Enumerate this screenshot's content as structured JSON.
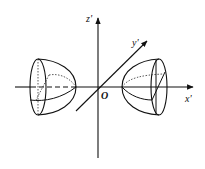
{
  "diagram": {
    "type": "3d-coordinate-sketch",
    "axes": {
      "x": {
        "label": "x'"
      },
      "y": {
        "label": "y'"
      },
      "z": {
        "label": "z'"
      },
      "origin": {
        "label": "O"
      }
    },
    "solids": [
      {
        "name": "left-dome-solid",
        "position": "negative x",
        "opens_toward": "origin"
      },
      {
        "name": "right-dome-solid",
        "position": "positive x",
        "opens_toward": "origin"
      }
    ],
    "colors": {
      "stroke": "#111111",
      "background": "#ffffff"
    }
  }
}
